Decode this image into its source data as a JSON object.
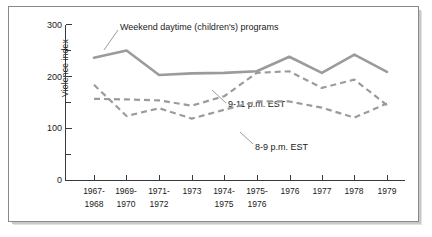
{
  "figure": {
    "frame": {
      "name": "chart-frame"
    },
    "background_color": "#ffffff",
    "line_color": "#9b9b9b",
    "axis_color": "#3a3a3a"
  },
  "chart_data": {
    "type": "line",
    "title": "",
    "xlabel": "",
    "ylabel": "Violence index",
    "ylim": [
      0,
      300
    ],
    "yticks": [
      0,
      100,
      200,
      300
    ],
    "ytick_labels": [
      "0",
      "100",
      "200",
      "300"
    ],
    "yminor_ticks": [
      50,
      150,
      250
    ],
    "grid": false,
    "legend": "inline-annotations",
    "categories": [
      "1967-\n1968",
      "1969-\n1970",
      "1971-\n1972",
      "1973",
      "1974-\n1975",
      "1975-\n1976",
      "1976",
      "1977",
      "1978",
      "1979"
    ],
    "category_lines": [
      [
        "1967-",
        "1968"
      ],
      [
        "1969-",
        "1970"
      ],
      [
        "1971-",
        "1972"
      ],
      [
        "1973",
        ""
      ],
      [
        "1974-",
        "1975"
      ],
      [
        "1975-",
        "1976"
      ],
      [
        "1976",
        ""
      ],
      [
        "1977",
        ""
      ],
      [
        "1978",
        ""
      ],
      [
        "1979",
        ""
      ]
    ],
    "series": [
      {
        "name": "Weekend daytime (children's) programs",
        "label": "Weekend daytime (children's) programs",
        "style": "solid",
        "color": "#9b9b9b",
        "values": [
          236,
          250,
          203,
          206,
          207,
          210,
          238,
          207,
          242,
          209
        ]
      },
      {
        "name": "9-11 p.m. EST",
        "label": "9-11 p.m. EST",
        "style": "dashed",
        "color": "#9b9b9b",
        "values": [
          157,
          156,
          154,
          144,
          162,
          207,
          210,
          178,
          194,
          145
        ]
      },
      {
        "name": "8-9 p.m. EST",
        "label": "8-9 p.m. EST",
        "style": "dashed",
        "color": "#9b9b9b",
        "values": [
          184,
          124,
          139,
          119,
          136,
          152,
          152,
          140,
          121,
          148
        ]
      }
    ],
    "annotations": [
      {
        "text": "Weekend daytime (children's) programs",
        "x": 120,
        "y": 27
      },
      {
        "text": "9-11 p.m. EST",
        "x": 228,
        "y": 104
      },
      {
        "text": "8-9 p.m. EST",
        "x": 255,
        "y": 147
      }
    ]
  }
}
